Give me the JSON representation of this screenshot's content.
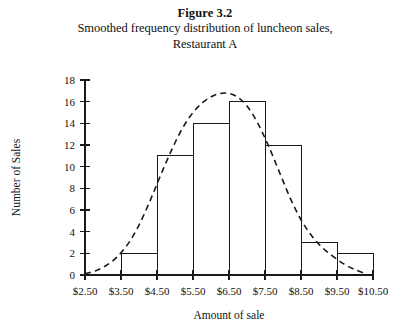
{
  "figure": {
    "number_label": "Figure 3.2",
    "caption_line1": "Smoothed frequency distribution of luncheon sales,",
    "caption_line2": "Restaurant A"
  },
  "colors": {
    "ink": "#1a1a1a",
    "background": "#ffffff"
  },
  "chart_data": {
    "type": "bar",
    "xlabel": "Amount of sale",
    "ylabel": "Number of Sales",
    "categories": [
      "$3.50-$4.50",
      "$4.50-$5.50",
      "$5.50-$6.50",
      "$6.50-$7.50",
      "$7.50-$8.50",
      "$8.50-$9.50",
      "$9.50-$10.50"
    ],
    "values": [
      2,
      11,
      14,
      16,
      12,
      3,
      2
    ],
    "bin_edges": [
      3.5,
      4.5,
      5.5,
      6.5,
      7.5,
      8.5,
      9.5,
      10.5
    ],
    "xlim": [
      2.5,
      10.5
    ],
    "ylim": [
      0,
      18
    ],
    "ytick_values": [
      0,
      2,
      4,
      6,
      8,
      10,
      12,
      14,
      16,
      18
    ],
    "ytick_labels": [
      "0",
      "2",
      "4",
      "6",
      "8",
      "10",
      "12",
      "14",
      "16",
      "18"
    ],
    "xtick_values": [
      2.5,
      3.5,
      4.5,
      5.5,
      6.5,
      7.5,
      8.5,
      9.5,
      10.5
    ],
    "xtick_labels": [
      "$2.50",
      "$3.50",
      "$4.50",
      "$5.50",
      "$6.50",
      "$7.50",
      "$8.50",
      "$9.50",
      "$10.50"
    ],
    "grid": false,
    "legend": false,
    "overlay": {
      "name": "smoothed frequency curve",
      "style": "dashed",
      "x": [
        2.5,
        2.8,
        3.1,
        3.4,
        3.7,
        4.0,
        4.3,
        4.6,
        4.9,
        5.2,
        5.5,
        5.8,
        6.1,
        6.4,
        6.7,
        7.0,
        7.3,
        7.6,
        7.9,
        8.2,
        8.5,
        8.8,
        9.1,
        9.4,
        9.7,
        10.0,
        10.3
      ],
      "y": [
        0.1,
        0.4,
        0.9,
        1.7,
        2.9,
        4.6,
        6.8,
        9.2,
        11.5,
        13.5,
        15.0,
        16.0,
        16.6,
        16.8,
        16.5,
        15.6,
        14.0,
        11.9,
        9.5,
        7.1,
        5.1,
        3.6,
        2.5,
        1.7,
        1.0,
        0.5,
        0.1
      ]
    }
  }
}
